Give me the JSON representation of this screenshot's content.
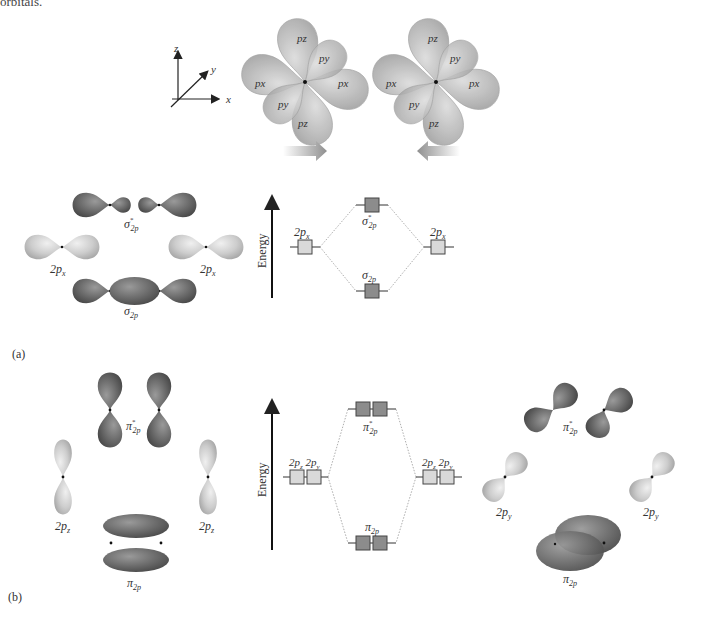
{
  "caption": {
    "text": "orbitals."
  },
  "axes": {
    "z": "z",
    "y": "y",
    "x": "x"
  },
  "top": {
    "atom_left": {
      "lobes": [
        "pz",
        "py",
        "px",
        "px",
        "py",
        "pz"
      ]
    },
    "atom_right": {
      "lobes": [
        "pz",
        "py",
        "px",
        "px",
        "py",
        "pz"
      ]
    },
    "arrows": [
      "right",
      "left"
    ]
  },
  "panel_a": {
    "label": "(a)",
    "energy_axis": "Energy",
    "orbitals": {
      "antibonding": "σ*2p",
      "left_atomic": "2px",
      "right_atomic": "2px",
      "bonding": "σ2p"
    },
    "mo_diagram": {
      "left_level": "2px",
      "right_level": "2px",
      "upper_level": "σ*2p",
      "lower_level": "σ2p"
    }
  },
  "panel_b": {
    "label": "(b)",
    "energy_axis": "Energy",
    "left_orbitals": {
      "antibonding": "π*2p",
      "left_atomic": "2pz",
      "right_atomic": "2pz",
      "bonding": "π2p"
    },
    "mo_diagram": {
      "left_levels": [
        "2pz",
        "2py"
      ],
      "right_levels": [
        "2pz",
        "2py"
      ],
      "upper_level": "π*2p",
      "lower_level": "π2p"
    },
    "right_orbitals": {
      "antibonding": "π*2p",
      "left_atomic": "2py",
      "right_atomic": "2py",
      "bonding": "π2p"
    }
  },
  "colors": {
    "light_lobe": "#cfcfcf",
    "dark_lobe": "#6e6e6e",
    "level_light": "#d9d9d9",
    "level_dark": "#8c8c8c",
    "arrow_gray": "#9a9a9a"
  }
}
